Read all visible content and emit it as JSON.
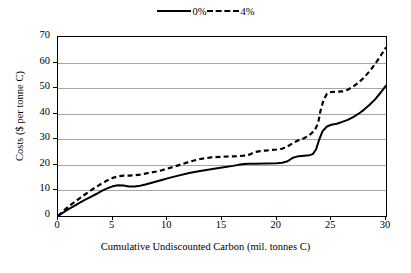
{
  "chart_data": {
    "type": "line",
    "title": "",
    "xlabel": "Cumulative Undiscounted Carbon (mil. tonnes C)",
    "ylabel": "Costs ($ per tonne C)",
    "xlim": [
      0,
      30
    ],
    "ylim": [
      0,
      70
    ],
    "xticks": [
      0,
      5,
      10,
      15,
      20,
      25,
      30
    ],
    "yticks": [
      0,
      10,
      20,
      30,
      40,
      50,
      60,
      70
    ],
    "grid": "horizontal",
    "legend_position": "top-center",
    "series": [
      {
        "name": "0%",
        "style": "solid",
        "color": "#000000",
        "points": [
          [
            0.0,
            0.0
          ],
          [
            0.5,
            1.4
          ],
          [
            1.0,
            2.8
          ],
          [
            1.5,
            4.0
          ],
          [
            2.0,
            5.2
          ],
          [
            2.5,
            6.4
          ],
          [
            3.0,
            7.5
          ],
          [
            3.5,
            8.6
          ],
          [
            4.0,
            9.8
          ],
          [
            4.5,
            10.8
          ],
          [
            5.0,
            11.6
          ],
          [
            5.5,
            12.0
          ],
          [
            6.0,
            11.9
          ],
          [
            6.5,
            11.5
          ],
          [
            7.0,
            11.5
          ],
          [
            7.5,
            11.8
          ],
          [
            8.0,
            12.3
          ],
          [
            8.5,
            12.9
          ],
          [
            9.0,
            13.5
          ],
          [
            9.5,
            14.1
          ],
          [
            10.0,
            14.7
          ],
          [
            11.0,
            15.8
          ],
          [
            12.0,
            16.8
          ],
          [
            13.0,
            17.6
          ],
          [
            14.0,
            18.3
          ],
          [
            15.0,
            19.0
          ],
          [
            16.0,
            19.6
          ],
          [
            16.5,
            20.0
          ],
          [
            17.0,
            20.3
          ],
          [
            17.5,
            20.4
          ],
          [
            18.0,
            20.4
          ],
          [
            19.0,
            20.5
          ],
          [
            20.0,
            20.6
          ],
          [
            20.5,
            20.8
          ],
          [
            21.0,
            21.4
          ],
          [
            21.5,
            22.8
          ],
          [
            22.0,
            23.4
          ],
          [
            22.5,
            23.6
          ],
          [
            23.0,
            23.8
          ],
          [
            23.3,
            24.2
          ],
          [
            23.6,
            26.0
          ],
          [
            23.9,
            30.0
          ],
          [
            24.2,
            33.2
          ],
          [
            24.6,
            35.0
          ],
          [
            25.0,
            35.7
          ],
          [
            25.5,
            36.1
          ],
          [
            26.0,
            36.8
          ],
          [
            26.5,
            37.6
          ],
          [
            27.0,
            38.7
          ],
          [
            27.5,
            40.0
          ],
          [
            28.0,
            41.6
          ],
          [
            28.5,
            43.5
          ],
          [
            29.0,
            45.6
          ],
          [
            29.5,
            48.2
          ],
          [
            30.0,
            51.0
          ]
        ]
      },
      {
        "name": "4%",
        "style": "dashed",
        "color": "#000000",
        "points": [
          [
            0.0,
            0.0
          ],
          [
            0.5,
            2.0
          ],
          [
            1.0,
            3.8
          ],
          [
            1.5,
            5.4
          ],
          [
            2.0,
            7.0
          ],
          [
            2.5,
            8.5
          ],
          [
            3.0,
            10.0
          ],
          [
            3.5,
            11.4
          ],
          [
            4.0,
            12.7
          ],
          [
            4.5,
            13.9
          ],
          [
            5.0,
            14.9
          ],
          [
            5.5,
            15.5
          ],
          [
            6.0,
            15.8
          ],
          [
            6.5,
            15.8
          ],
          [
            7.0,
            15.9
          ],
          [
            7.5,
            16.2
          ],
          [
            8.0,
            16.6
          ],
          [
            8.5,
            17.0
          ],
          [
            9.0,
            17.4
          ],
          [
            9.5,
            17.9
          ],
          [
            10.0,
            18.5
          ],
          [
            11.0,
            19.8
          ],
          [
            12.0,
            21.2
          ],
          [
            13.0,
            22.3
          ],
          [
            14.0,
            22.9
          ],
          [
            15.0,
            23.2
          ],
          [
            16.0,
            23.3
          ],
          [
            16.5,
            23.4
          ],
          [
            17.0,
            23.6
          ],
          [
            17.5,
            24.0
          ],
          [
            18.0,
            25.0
          ],
          [
            18.5,
            25.4
          ],
          [
            19.0,
            25.6
          ],
          [
            20.0,
            26.0
          ],
          [
            20.5,
            26.3
          ],
          [
            21.0,
            27.2
          ],
          [
            21.5,
            28.6
          ],
          [
            22.0,
            29.6
          ],
          [
            22.5,
            30.4
          ],
          [
            23.0,
            31.6
          ],
          [
            23.5,
            33.6
          ],
          [
            23.8,
            36.5
          ],
          [
            24.0,
            41.0
          ],
          [
            24.3,
            45.5
          ],
          [
            24.6,
            47.8
          ],
          [
            25.0,
            48.5
          ],
          [
            25.5,
            48.6
          ],
          [
            26.0,
            48.7
          ],
          [
            26.5,
            49.4
          ],
          [
            27.0,
            50.6
          ],
          [
            27.5,
            52.2
          ],
          [
            28.0,
            54.2
          ],
          [
            28.5,
            56.6
          ],
          [
            29.0,
            59.4
          ],
          [
            29.5,
            62.6
          ],
          [
            30.0,
            66.0
          ]
        ]
      }
    ]
  },
  "legend": {
    "entries": [
      {
        "label": "0%",
        "style": "solid"
      },
      {
        "label": "4%",
        "style": "dashed"
      }
    ]
  }
}
